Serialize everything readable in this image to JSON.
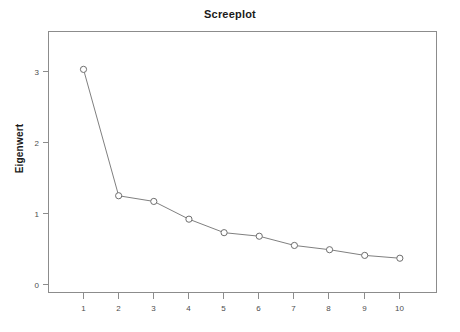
{
  "chart_data": {
    "type": "line",
    "title": "Screeplot",
    "xlabel": "",
    "ylabel": "Eigenwert",
    "x": [
      1,
      2,
      3,
      4,
      5,
      6,
      7,
      8,
      9,
      10
    ],
    "values": [
      3.03,
      1.25,
      1.17,
      0.92,
      0.73,
      0.68,
      0.55,
      0.49,
      0.41,
      0.37
    ],
    "xtick_labels": [
      "1",
      "2",
      "3",
      "4",
      "5",
      "6",
      "7",
      "8",
      "9",
      "10"
    ],
    "ytick_labels": [
      "0",
      "1",
      "2",
      "3"
    ],
    "ytick_values": [
      0,
      1,
      2,
      3
    ],
    "xlim": [
      0.5,
      10.5
    ],
    "ylim": [
      -0.2,
      3.45
    ],
    "grid": false,
    "legend": "none",
    "marker": "open-circle",
    "line_color": "#808080",
    "marker_color": "#6e6e6e",
    "frame_color": "#8c8c8c",
    "text_color": "#1a1a1a"
  }
}
